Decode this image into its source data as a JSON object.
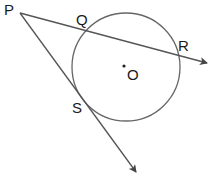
{
  "diagram": {
    "colors": {
      "stroke": "#555555",
      "text": "#1a1a1a",
      "background": "#ffffff"
    },
    "circle": {
      "center_label": "O",
      "cx": 126,
      "cy": 67,
      "r": 54
    },
    "points": {
      "P": {
        "label": "P",
        "x": 20,
        "y": 13
      },
      "Q": {
        "label": "Q",
        "x": 86,
        "y": 33
      },
      "R": {
        "label": "R",
        "x": 177,
        "y": 56
      },
      "S": {
        "label": "S",
        "x": 88,
        "y": 97
      },
      "O": {
        "label": "O",
        "x": 124,
        "y": 66
      }
    },
    "lines": [
      {
        "name": "secant PQR",
        "from": "P",
        "through": [
          "Q",
          "R"
        ],
        "arrow": true
      },
      {
        "name": "tangent PS",
        "from": "P",
        "through": [
          "S"
        ],
        "arrow": true
      }
    ]
  }
}
